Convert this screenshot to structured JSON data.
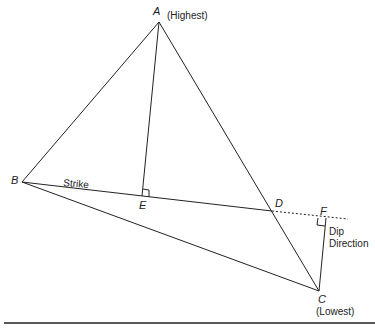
{
  "diagram": {
    "points": {
      "A": {
        "label": "A",
        "note": "(Highest)"
      },
      "B": {
        "label": "B"
      },
      "C": {
        "label": "C",
        "note": "(Lowest)"
      },
      "D": {
        "label": "D"
      },
      "E": {
        "label": "E"
      },
      "F": {
        "label": "F"
      }
    },
    "labels": {
      "strike": "Strike",
      "dip_line1": "Dip",
      "dip_line2": "Direction"
    },
    "colors": {
      "line": "#222222",
      "background": "#ffffff"
    }
  }
}
